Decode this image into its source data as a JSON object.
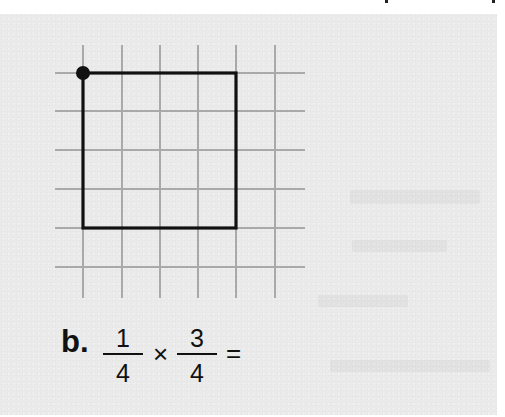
{
  "colors": {
    "panel_background": "#eaeaea",
    "page_background": "#ffffff",
    "grid_line": "#a9a9a9",
    "shape_outline": "#111111",
    "text": "#111111"
  },
  "figure": {
    "grid": {
      "vertical_lines": 6,
      "horizontal_lines": 6
    },
    "square": {
      "columns": 4,
      "rows": 4
    },
    "dot": "top-left corner of square"
  },
  "problem": {
    "label": "b.",
    "fraction1": {
      "numerator": "1",
      "denominator": "4"
    },
    "operator": "×",
    "fraction2": {
      "numerator": "3",
      "denominator": "4"
    },
    "equals": "="
  }
}
